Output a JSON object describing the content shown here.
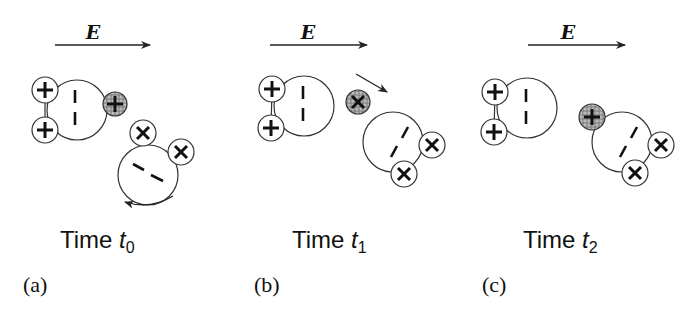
{
  "figure": {
    "type": "diagram",
    "colors": {
      "stroke": "#333333",
      "text": "#111111",
      "shaded_ion": "#8a8a8a",
      "background": "#ffffff"
    },
    "panels": [
      {
        "id": "a",
        "panel_label": "(a)",
        "field_label": "E",
        "time_prefix": "Time ",
        "time_var": "t",
        "time_sub": "0",
        "annotations": [
          "rotation arrow (counter-clockwise) under lower molecule"
        ]
      },
      {
        "id": "b",
        "panel_label": "(b)",
        "field_label": "E",
        "time_prefix": "Time ",
        "time_var": "t",
        "time_sub": "1",
        "annotations": [
          "motion arrow showing shaded ion moving right-down"
        ]
      },
      {
        "id": "c",
        "panel_label": "(c)",
        "field_label": "E",
        "time_prefix": "Time ",
        "time_var": "t",
        "time_sub": "2",
        "annotations": [
          "shaded ion attached to lower molecule"
        ]
      }
    ]
  }
}
